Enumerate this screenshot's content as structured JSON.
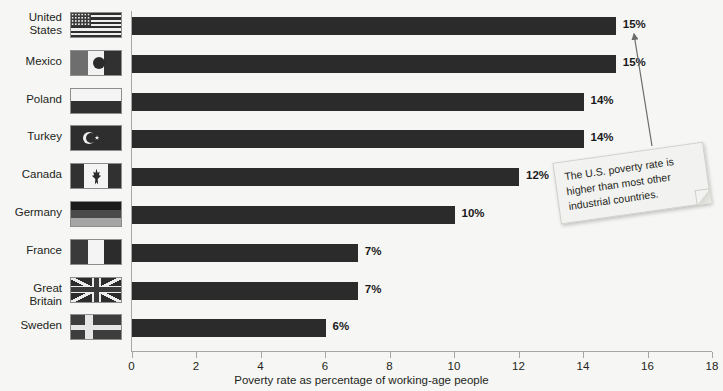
{
  "chart_data": {
    "type": "bar",
    "orientation": "horizontal",
    "title": "",
    "xlabel": "Poverty rate as percentage of working-age people",
    "ylabel": "",
    "xlim": [
      0,
      18
    ],
    "xticks": [
      0,
      2,
      4,
      6,
      8,
      10,
      12,
      14,
      16,
      18
    ],
    "grid": false,
    "legend": null,
    "categories": [
      "United States",
      "Mexico",
      "Poland",
      "Turkey",
      "Canada",
      "Germany",
      "France",
      "Great Britain",
      "Sweden"
    ],
    "values": [
      15,
      15,
      14,
      14,
      12,
      10,
      7,
      7,
      6
    ],
    "data_labels": [
      "15%",
      "15%",
      "14%",
      "14%",
      "12%",
      "10%",
      "7%",
      "7%",
      "6%"
    ],
    "bar_color": "#2b2b2b",
    "annotations": [
      {
        "text": "The U.S. poverty rate is higher than most other industrial countries.",
        "points_to": "United States"
      }
    ]
  },
  "axis": {
    "title": "Poverty rate as percentage of working-age people",
    "ticks": [
      {
        "label": "0",
        "value": 0
      },
      {
        "label": "2",
        "value": 2
      },
      {
        "label": "4",
        "value": 4
      },
      {
        "label": "6",
        "value": 6
      },
      {
        "label": "8",
        "value": 8
      },
      {
        "label": "10",
        "value": 10
      },
      {
        "label": "12",
        "value": 12
      },
      {
        "label": "14",
        "value": 14
      },
      {
        "label": "16",
        "value": 16
      },
      {
        "label": "18",
        "value": 18
      }
    ]
  },
  "rows": [
    {
      "label_line1": "United",
      "label_line2": "States",
      "label": "United States",
      "value": 15,
      "value_label": "15%",
      "flag": "flag-united-states"
    },
    {
      "label_line1": "Mexico",
      "label_line2": "",
      "label": "Mexico",
      "value": 15,
      "value_label": "15%",
      "flag": "flag-mexico"
    },
    {
      "label_line1": "Poland",
      "label_line2": "",
      "label": "Poland",
      "value": 14,
      "value_label": "14%",
      "flag": "flag-poland"
    },
    {
      "label_line1": "Turkey",
      "label_line2": "",
      "label": "Turkey",
      "value": 14,
      "value_label": "14%",
      "flag": "flag-turkey"
    },
    {
      "label_line1": "Canada",
      "label_line2": "",
      "label": "Canada",
      "value": 12,
      "value_label": "12%",
      "flag": "flag-canada"
    },
    {
      "label_line1": "Germany",
      "label_line2": "",
      "label": "Germany",
      "value": 10,
      "value_label": "10%",
      "flag": "flag-germany"
    },
    {
      "label_line1": "France",
      "label_line2": "",
      "label": "France",
      "value": 7,
      "value_label": "7%",
      "flag": "flag-france"
    },
    {
      "label_line1": "Great Britain",
      "label_line2": "",
      "label": "Great Britain",
      "value": 7,
      "value_label": "7%",
      "flag": "flag-great-britain"
    },
    {
      "label_line1": "Sweden",
      "label_line2": "",
      "label": "Sweden",
      "value": 6,
      "value_label": "6%",
      "flag": "flag-sweden"
    }
  ],
  "callout": {
    "text": "The U.S. poverty rate is higher than most other industrial countries."
  },
  "colors": {
    "bar": "#2b2b2b",
    "background": "#f6f6f5",
    "axis": "#a6a6a6",
    "text": "#231f20"
  }
}
